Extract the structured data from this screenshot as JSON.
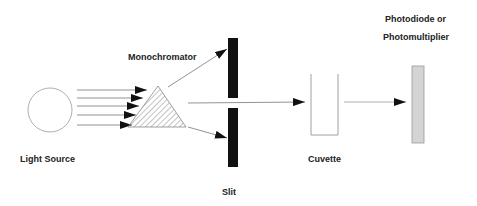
{
  "diagram": {
    "labels": {
      "light_source": "Light Source",
      "monochromator": "Monochromator",
      "slit": "Slit",
      "cuvette": "Cuvette",
      "detector_line1": "Photodiode or",
      "detector_line2": "Photomultiplier"
    },
    "colors": {
      "outline": "#888888",
      "slit": "#111111",
      "detector_fill": "#d4d4d4",
      "arrow": "#111111"
    }
  }
}
